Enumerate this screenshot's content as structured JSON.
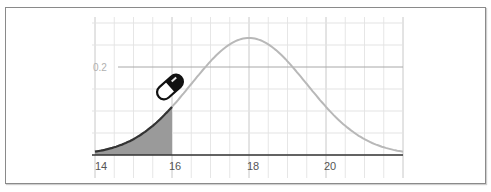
{
  "chart_data": {
    "type": "area",
    "title": "",
    "xlabel": "",
    "ylabel": "",
    "distribution": "normal",
    "mean": 18,
    "sd": 1.5,
    "x_ticks": [
      "14",
      "16",
      "18",
      "20"
    ],
    "y_ticks": [
      "0.2"
    ],
    "xlim": [
      14,
      22
    ],
    "ylim": [
      0,
      0.3
    ],
    "grid": true,
    "grid_x_step": 0.5,
    "grid_y_step": 0.05,
    "shaded_region": {
      "from": 14,
      "to": 16,
      "color": "#999999"
    },
    "curve_color": "#b5b5b5",
    "shaded_curve_color": "#333333",
    "series": [
      {
        "name": "density",
        "x": [
          14,
          14.5,
          15,
          15.5,
          16,
          16.5,
          17,
          17.5,
          18,
          18.5,
          19,
          19.5,
          20,
          20.5,
          21,
          21.5,
          22
        ],
        "values": [
          0.008,
          0.018,
          0.036,
          0.067,
          0.109,
          0.161,
          0.213,
          0.252,
          0.266,
          0.252,
          0.213,
          0.161,
          0.109,
          0.067,
          0.036,
          0.018,
          0.008
        ]
      }
    ],
    "annotations": [
      {
        "type": "icon",
        "name": "pill-capsule-icon",
        "x": 15.9,
        "y": 0.16
      }
    ]
  },
  "labels": {
    "x14": "14",
    "x16": "16",
    "x18": "18",
    "x20": "20",
    "y02": "0.2"
  }
}
